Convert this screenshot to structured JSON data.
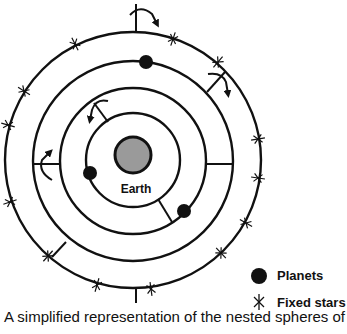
{
  "diagram": {
    "title": "Nested spheres",
    "center": {
      "x": 133,
      "y": 160
    },
    "spheres": [
      {
        "name": "fixed-star-sphere",
        "radius": 128
      },
      {
        "name": "outer-planet-sphere",
        "radius": 100
      },
      {
        "name": "middle-planet-sphere",
        "radius": 73
      },
      {
        "name": "inner-planet-sphere",
        "radius": 47
      }
    ],
    "earth": {
      "label": "Earth",
      "radius": 18,
      "fill": "#9a9a9a"
    },
    "planets": [
      {
        "x": 146,
        "y": 62
      },
      {
        "x": 90,
        "y": 173
      },
      {
        "x": 184,
        "y": 211
      }
    ],
    "fixed_stars": [
      {
        "x": 75,
        "y": 44
      },
      {
        "x": 173,
        "y": 39
      },
      {
        "x": 218,
        "y": 62
      },
      {
        "x": 24,
        "y": 91
      },
      {
        "x": 8,
        "y": 125
      },
      {
        "x": 258,
        "y": 139
      },
      {
        "x": 258,
        "y": 178
      },
      {
        "x": 10,
        "y": 202
      },
      {
        "x": 246,
        "y": 223
      },
      {
        "x": 48,
        "y": 256
      },
      {
        "x": 221,
        "y": 253
      },
      {
        "x": 97,
        "y": 285
      },
      {
        "x": 151,
        "y": 289
      }
    ],
    "colors": {
      "line": "#111111",
      "planet": "#111111",
      "earth_fill": "#9a9a9a"
    }
  },
  "legend": {
    "planets_label": "Planets",
    "fixed_stars_label": "Fixed stars"
  },
  "caption": "A simplified representation of the nested spheres of"
}
